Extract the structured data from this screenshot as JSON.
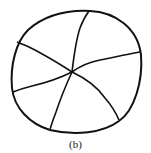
{
  "figure": {
    "caption": "(b)",
    "shape": "circle",
    "segments": 6,
    "stroke_color": "#111111",
    "background": "#ffffff"
  }
}
